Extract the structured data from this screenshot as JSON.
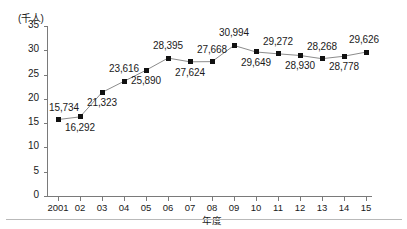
{
  "chart_data": {
    "type": "line",
    "title": "",
    "subtitle": "",
    "xlabel": "年度",
    "ylabel": "",
    "unit_label": "(千人)",
    "grid": false,
    "legend": null,
    "xlim": [
      0,
      16
    ],
    "ylim": [
      0,
      35
    ],
    "ytick_step": 5,
    "yticks": [
      "35",
      "30",
      "25",
      "20",
      "15",
      "10",
      "5",
      "0"
    ],
    "categories": [
      "2001",
      "02",
      "03",
      "04",
      "05",
      "06",
      "07",
      "08",
      "09",
      "10",
      "11",
      "12",
      "13",
      "14",
      "15"
    ],
    "values": [
      15734,
      16292,
      21323,
      23616,
      25890,
      28395,
      27624,
      27668,
      30994,
      29649,
      29272,
      28930,
      28268,
      28778,
      29626
    ],
    "point_labels": [
      "15,734",
      "16,292",
      "21,323",
      "23,616",
      "25,890",
      "28,395",
      "27,624",
      "27,668",
      "30,994",
      "29,649",
      "29,272",
      "28,930",
      "28,268",
      "28,778",
      "29,626"
    ],
    "label_positions": [
      "above",
      "below",
      "below",
      "above",
      "below",
      "above",
      "below",
      "above",
      "above",
      "below",
      "above",
      "below",
      "above",
      "below",
      "above"
    ],
    "series_name": "",
    "marker": "square",
    "marker_color": "#111111",
    "line_color": "#8c8c8c",
    "axis_color": "#7a7a7a",
    "value_unit": "人",
    "y_unit_scale": "千人"
  }
}
